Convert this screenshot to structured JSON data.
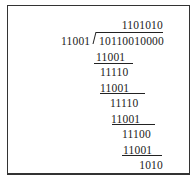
{
  "division": {
    "quotient": "1101010",
    "divisor": "11001",
    "dividend": "10110010000",
    "steps": [
      {
        "subtract": "11001",
        "remainder": "11110"
      },
      {
        "subtract": "11001",
        "remainder": "11110"
      },
      {
        "subtract": "11001",
        "remainder": "11100"
      },
      {
        "subtract": "11001",
        "remainder": "1010"
      }
    ],
    "final_remainder": "1010"
  }
}
